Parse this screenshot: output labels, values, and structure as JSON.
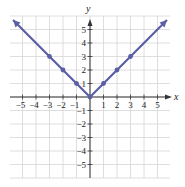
{
  "chart_data": {
    "type": "line",
    "title": "",
    "function": "y = |x|",
    "xlabel": "x",
    "ylabel": "y",
    "xlim": [
      -6,
      6
    ],
    "ylim": [
      -6,
      6
    ],
    "grid": true,
    "x_ticks": [
      -5,
      -4,
      -3,
      -2,
      -1,
      1,
      2,
      3,
      4,
      5
    ],
    "y_ticks": [
      -5,
      -4,
      -3,
      -2,
      -1,
      1,
      2,
      3,
      4,
      5
    ],
    "x_tick_labels": [
      "−5",
      "−4",
      "−3",
      "−2",
      "−1",
      "1",
      "2",
      "3",
      "4",
      "5"
    ],
    "y_tick_labels": [
      "−5",
      "−4",
      "−3",
      "−2",
      "−1",
      "1",
      "2",
      "3",
      "4",
      "5"
    ],
    "series": [
      {
        "name": "y = |x|",
        "color": "#5b5fa6",
        "arrows_at_ends": true,
        "x": [
          -5.7,
          -3,
          -2,
          -1,
          0,
          1,
          2,
          3,
          5.7
        ],
        "y": [
          5.7,
          3,
          2,
          1,
          0,
          1,
          2,
          3,
          5.7
        ],
        "marked_points": [
          [
            -3,
            3
          ],
          [
            -2,
            2
          ],
          [
            -1,
            1
          ],
          [
            0,
            0
          ],
          [
            1,
            1
          ],
          [
            2,
            2
          ],
          [
            3,
            3
          ]
        ]
      }
    ]
  },
  "colors": {
    "grid": "#d6d6d6",
    "axis": "#333333",
    "curve": "#5b5fa6",
    "background": "#ffffff"
  }
}
